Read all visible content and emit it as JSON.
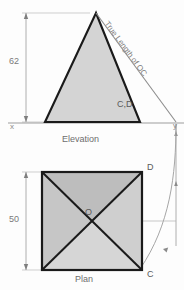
{
  "drawing": {
    "type": "orthographic-projection",
    "description": "Pyramid elevation and plan with true length of OC construction",
    "views": {
      "elevation": {
        "label": "Elevation",
        "height_dimension": "62",
        "apex_point": "O",
        "base_points_label": "C,D",
        "true_length_label": "True Length of OC",
        "ground_line_left": "x",
        "ground_line_right": "y"
      },
      "plan": {
        "label": "Plan",
        "side_dimension": "50",
        "centre_label": "O",
        "corner_top_right": "D",
        "corner_bottom_right": "C"
      }
    },
    "colors": {
      "fill_light": "#d6d6d6",
      "fill_mid": "#c4c4c4",
      "fill_dark": "#b0b0b0",
      "outline": "#1a1a1a",
      "thin_line": "#9a9a9a",
      "text": "#6b6b6b",
      "background": "#fdfdfd"
    },
    "geometry": {
      "elevation": {
        "apex": [
          96,
          13
        ],
        "base_left": [
          45,
          122
        ],
        "base_right": [
          140,
          122
        ],
        "true_length_end": [
          176,
          122
        ],
        "ground_line_y": 123
      },
      "plan": {
        "square_left": 42,
        "square_top": 172,
        "square_right": 142,
        "square_bottom": 270,
        "centre": [
          92,
          221
        ]
      }
    }
  }
}
